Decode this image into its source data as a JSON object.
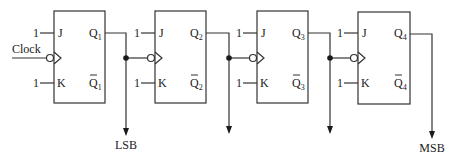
{
  "diagram": {
    "type": "4-bit ripple counter (JK flip-flops)",
    "input_label": "Clock",
    "constant_input": "1",
    "flip_flops": [
      {
        "id": "ff1",
        "j": "J",
        "k": "K",
        "q": "Q",
        "qbar": "Q",
        "index": "1",
        "x": 54
      },
      {
        "id": "ff2",
        "j": "J",
        "k": "K",
        "q": "Q",
        "qbar": "Q",
        "index": "2",
        "x": 155
      },
      {
        "id": "ff3",
        "j": "J",
        "k": "K",
        "q": "Q",
        "qbar": "Q",
        "index": "3",
        "x": 257
      },
      {
        "id": "ff4",
        "j": "J",
        "k": "K",
        "q": "Q",
        "qbar": "Q",
        "index": "4",
        "x": 358
      }
    ],
    "outputs": {
      "lsb_label": "LSB",
      "msb_label": "MSB"
    }
  }
}
